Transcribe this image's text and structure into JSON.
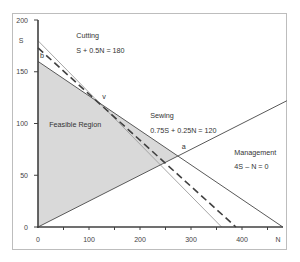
{
  "chart_data": {
    "type": "line",
    "title": "",
    "xlabel": "N",
    "ylabel": "S",
    "xlim": [
      0,
      480
    ],
    "ylim": [
      0,
      200
    ],
    "x_ticks": [
      0,
      100,
      200,
      300,
      400
    ],
    "x_minor_ticks": [
      50,
      150,
      250,
      350,
      450
    ],
    "x_tick_labels": [
      "0",
      "100",
      "200",
      "300",
      "400"
    ],
    "y_ticks": [
      0,
      50,
      100,
      150,
      200
    ],
    "y_tick_labels": [
      "0",
      "50",
      "100",
      "150",
      "200"
    ],
    "x_axis_label": "N",
    "y_axis_label": "S",
    "grid": false,
    "series": [
      {
        "name": "Cutting",
        "equation": "S + 0.5N = 180",
        "style": "solid-light",
        "color": "#a6a6a6",
        "points": [
          [
            0,
            180
          ],
          [
            360,
            0
          ]
        ]
      },
      {
        "name": "Sewing",
        "equation": "0.75S + 0.25N = 120",
        "style": "solid",
        "color": "#595959",
        "points": [
          [
            0,
            160
          ],
          [
            480,
            0
          ]
        ]
      },
      {
        "name": "Management",
        "equation": "4S – N = 0",
        "style": "solid",
        "color": "#595959",
        "points": [
          [
            0,
            0
          ],
          [
            488,
            122
          ]
        ]
      },
      {
        "name": "Isoprofit",
        "equation": "",
        "style": "dashed",
        "color": "#404040",
        "points": [
          [
            0,
            173
          ],
          [
            388,
            0
          ]
        ]
      }
    ],
    "feasible_region": {
      "label": "Feasible Region",
      "color": "#d9d9d9",
      "vertices": [
        [
          0,
          0
        ],
        [
          0,
          160
        ],
        [
          120,
          120
        ],
        [
          274.3,
          68.6
        ]
      ]
    },
    "annotations": [
      {
        "text": "Cutting",
        "at": [
          75,
          183
        ]
      },
      {
        "text": "S + 0.5N = 180",
        "at": [
          75,
          168
        ]
      },
      {
        "text": "Sewing",
        "at": [
          220,
          105
        ]
      },
      {
        "text": "0.75S + 0.25N = 120",
        "at": [
          220,
          91
        ]
      },
      {
        "text": "Management",
        "at": [
          385,
          70
        ]
      },
      {
        "text": "4S – N = 0",
        "at": [
          385,
          56
        ]
      },
      {
        "text": "Feasible Region",
        "at": [
          22,
          97
        ]
      },
      {
        "text": "v",
        "at": [
          126,
          124
        ]
      },
      {
        "text": "a",
        "at": [
          282,
          75
        ]
      },
      {
        "text": "b",
        "at": [
          4,
          163
        ]
      }
    ]
  }
}
